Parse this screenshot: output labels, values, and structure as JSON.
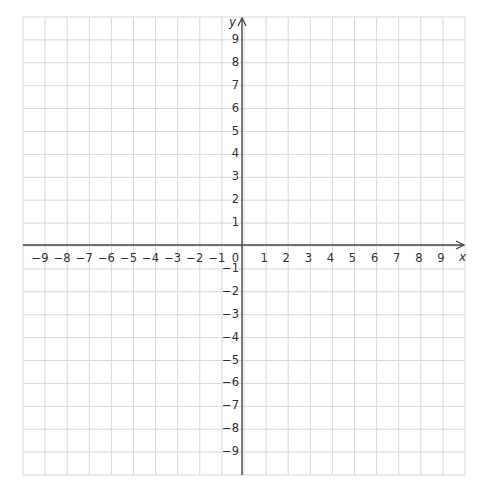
{
  "chart_data": {
    "type": "scatter",
    "title": "",
    "xlabel": "x",
    "ylabel": "y",
    "xlim": [
      -10,
      10
    ],
    "ylim": [
      -10,
      10
    ],
    "grid": true,
    "x_ticks": [
      -9,
      -8,
      -7,
      -6,
      -5,
      -4,
      -3,
      -2,
      -1,
      1,
      2,
      3,
      4,
      5,
      6,
      7,
      8,
      9
    ],
    "y_ticks": [
      -9,
      -8,
      -7,
      -6,
      -5,
      -4,
      -3,
      -2,
      -1,
      1,
      2,
      3,
      4,
      5,
      6,
      7,
      8,
      9
    ],
    "origin_label": "0",
    "series": []
  },
  "colors": {
    "grid": "#d9d9d9",
    "axis": "#444444",
    "text": "#333333"
  }
}
